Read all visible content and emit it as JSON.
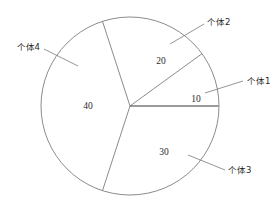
{
  "chart_data": {
    "type": "pie",
    "title": "",
    "subtitle": "",
    "xlabel": "",
    "ylabel": "",
    "grid": false,
    "legend_position": "none",
    "total": 100,
    "categories": [
      "个体1",
      "个体2",
      "个体3",
      "个体4"
    ],
    "values": [
      10,
      20,
      30,
      40
    ],
    "slices": [
      {
        "label": "个体1",
        "value": "10",
        "value_number": 10,
        "percent": "10%",
        "start_angle_deg": 0,
        "end_angle_deg": 36,
        "value_x": 196,
        "value_y": 100,
        "label_x": 247,
        "label_y": 81,
        "leader_x1": 205,
        "leader_y1": 93,
        "leader_x2": 243,
        "leader_y2": 81
      },
      {
        "label": "个体2",
        "value": "20",
        "value_number": 20,
        "percent": "20%",
        "start_angle_deg": 36,
        "end_angle_deg": 108,
        "value_x": 161,
        "value_y": 62,
        "label_x": 207,
        "label_y": 22,
        "leader_x1": 170,
        "leader_y1": 44,
        "leader_x2": 204,
        "leader_y2": 24
      },
      {
        "label": "个体3",
        "value": "30",
        "value_number": 30,
        "percent": "30%",
        "start_angle_deg": 252,
        "end_angle_deg": 360,
        "value_x": 164,
        "value_y": 153,
        "label_x": 228,
        "label_y": 170,
        "leader_x1": 188,
        "leader_y1": 155,
        "leader_x2": 225,
        "leader_y2": 170
      },
      {
        "label": "个体4",
        "value": "40",
        "value_number": 40,
        "percent": "40%",
        "start_angle_deg": 108,
        "end_angle_deg": 252,
        "value_x": 88,
        "value_y": 107,
        "label_x": 40,
        "label_y": 47,
        "leader_x1": 44,
        "leader_y1": 49,
        "leader_x2": 78,
        "leader_y2": 66
      }
    ],
    "geometry": {
      "center_x": 130,
      "center_y": 106,
      "radius": 89
    },
    "colors": {
      "background": "#ffffff",
      "outline": "#6d6d6d",
      "baseline_divider": "#9a9a9a",
      "leader": "#7a7a7a",
      "value_text": "#2b2b2b",
      "category_text": "#1f1f1f"
    }
  }
}
